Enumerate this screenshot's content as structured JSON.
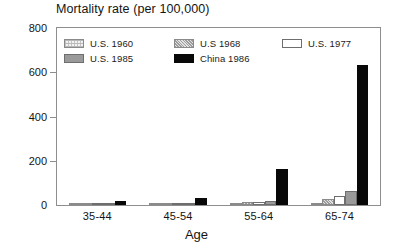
{
  "chart_data": {
    "type": "bar",
    "title": "Mortality rate (per 100,000)",
    "xlabel": "Age",
    "ylabel": "",
    "ylim": [
      0,
      800
    ],
    "yticks": [
      0,
      200,
      400,
      600,
      800
    ],
    "ytick_labels": [
      "0",
      "200",
      "400",
      "600",
      "800"
    ],
    "grid": false,
    "legend_position": "inside-top-left",
    "categories": [
      "35-44",
      "45-54",
      "55-64",
      "65-74"
    ],
    "series": [
      {
        "name": "U.S. 1960",
        "values": [
          2,
          4,
          10,
          10
        ],
        "fill": "hatch"
      },
      {
        "name": "U.S 1968",
        "values": [
          2,
          5,
          14,
          25
        ],
        "fill": "dots"
      },
      {
        "name": "U.S. 1977",
        "values": [
          2,
          6,
          14,
          40
        ],
        "fill": "white"
      },
      {
        "name": "U.S. 1985",
        "values": [
          2,
          7,
          20,
          65
        ],
        "fill": "gray"
      },
      {
        "name": "China 1986",
        "values": [
          18,
          30,
          163,
          632
        ],
        "fill": "black"
      }
    ]
  },
  "legend": {
    "entries": [
      {
        "label": "U.S. 1960",
        "fill": "hatch"
      },
      {
        "label": "U.S 1968",
        "fill": "dots"
      },
      {
        "label": "U.S. 1977",
        "fill": "white"
      },
      {
        "label": "U.S. 1985",
        "fill": "gray"
      },
      {
        "label": "China 1986",
        "fill": "black"
      }
    ]
  },
  "colors": {
    "axis": "#8e8e8e",
    "text": "#141414",
    "china": "#080808",
    "us1985": "#9a9a9a",
    "background": "#ffffff"
  }
}
